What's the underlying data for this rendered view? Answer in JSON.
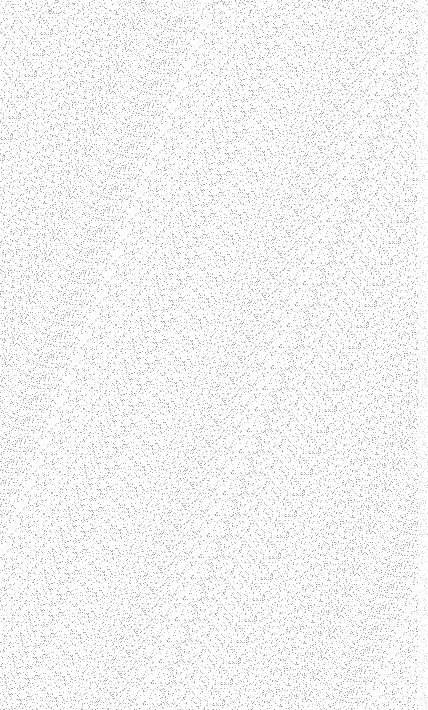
{
  "surface": {
    "description": "grain/speckle noise texture",
    "background_color": "#fdfdfd",
    "speckle_color": "#8a8a8a",
    "speckle_density": 0.16,
    "width": 428,
    "height": 710
  }
}
